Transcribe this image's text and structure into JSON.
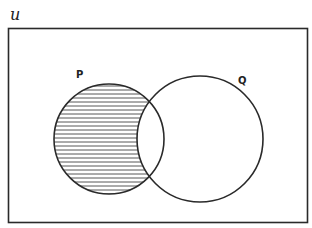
{
  "diagram": {
    "type": "venn",
    "universal_label": "u",
    "sets": [
      {
        "name": "P",
        "label": "P"
      },
      {
        "name": "Q",
        "label": "Q"
      }
    ],
    "shaded_region": "P - Q",
    "shading_style": "horizontal-lines",
    "colors": {
      "stroke": "#2a2a2a",
      "hatch": "#555555",
      "background": "#ffffff"
    }
  }
}
